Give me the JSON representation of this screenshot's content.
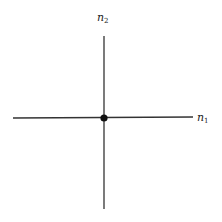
{
  "diagram": {
    "axes": {
      "horizontal": {
        "label": "n",
        "subscript": "1"
      },
      "vertical": {
        "label": "n",
        "subscript": "2"
      }
    },
    "origin_point": {
      "marker": "filled-dot"
    },
    "colors": {
      "line": "#333333",
      "dot": "#111111",
      "background": "#ffffff"
    }
  }
}
